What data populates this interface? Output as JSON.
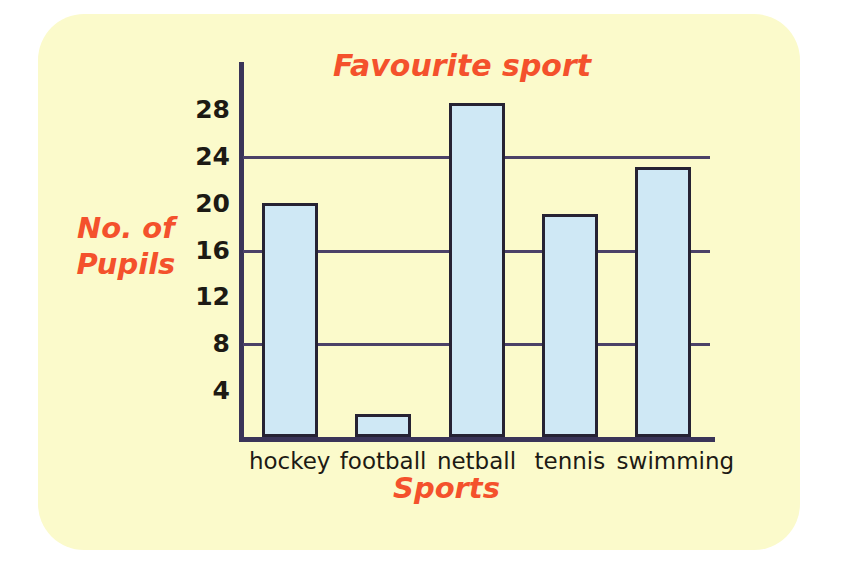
{
  "card": {
    "background_color": "#fbfacb",
    "page_background_color": "#ffffff"
  },
  "colors": {
    "title_accent": "#f4512c",
    "bar_fill": "#cfe8f5",
    "bar_outline": "#262233",
    "axis": "#3a3458",
    "gridline": "#4b4168",
    "tick_text": "#1d1a14"
  },
  "chart_data": {
    "type": "bar",
    "title": "Favourite sport",
    "xlabel": "Sports",
    "ylabel_line1": "No. of",
    "ylabel_line2": "Pupils",
    "ylabel": "No. of Pupils",
    "categories": [
      "hockey",
      "football",
      "netball",
      "tennis",
      "swimming"
    ],
    "values": [
      20,
      2,
      28.5,
      19,
      23
    ],
    "ylim": [
      0,
      32
    ],
    "yticks": [
      4,
      8,
      12,
      16,
      20,
      24,
      28
    ],
    "ytick_labels": [
      "4",
      "8",
      "12",
      "16",
      "20",
      "24",
      "28"
    ],
    "gridlines_at": [
      8,
      16,
      24
    ],
    "grid": true,
    "legend": "none"
  }
}
